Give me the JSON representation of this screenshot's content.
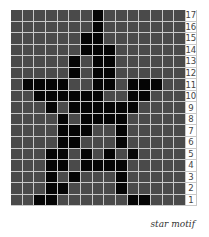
{
  "title": "star motif",
  "colors": {
    "background": "#4a4a4a",
    "motif": "#050505",
    "gridline": "#c8c8c8"
  },
  "chart_data": {
    "type": "heatmap",
    "title": "star motif",
    "columns": 15,
    "rows": 17,
    "row_labels": [
      17,
      16,
      15,
      14,
      13,
      12,
      11,
      10,
      9,
      8,
      7,
      6,
      5,
      4,
      3,
      2,
      1
    ],
    "filled_cells_by_row": {
      "17": [
        8
      ],
      "16": [
        8
      ],
      "15": [
        7,
        8
      ],
      "14": [
        7,
        8,
        9
      ],
      "13": [
        6,
        8,
        9
      ],
      "12": [
        6,
        8,
        9
      ],
      "11": [
        2,
        3,
        4,
        5,
        8,
        9,
        11,
        12,
        13
      ],
      "10": [
        3,
        4,
        5,
        6,
        7,
        8,
        11,
        12
      ],
      "9": [
        4,
        6,
        7,
        8,
        9,
        10,
        11
      ],
      "8": [
        5,
        7,
        8,
        9,
        10
      ],
      "7": [
        5,
        6,
        7,
        10
      ],
      "6": [
        5,
        6,
        10
      ],
      "5": [
        4,
        5,
        7,
        9,
        11
      ],
      "4": [
        4,
        5,
        7,
        8,
        9,
        10
      ],
      "3": [
        4,
        6,
        10
      ],
      "2": [
        4,
        5,
        10
      ],
      "1": [
        3,
        4,
        11,
        12
      ]
    }
  }
}
